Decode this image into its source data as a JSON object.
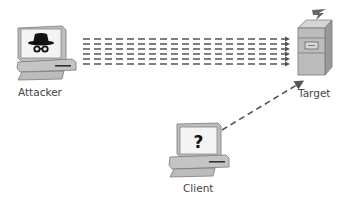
{
  "nodes": {
    "attacker": {
      "label": "Attacker",
      "icon": "spy-icon"
    },
    "target": {
      "label": "Target",
      "icon": "server-icon"
    },
    "client": {
      "label": "Client",
      "icon": "question-icon",
      "screen_glyph": "?"
    }
  },
  "edges": [
    {
      "from": "attacker",
      "to": "target",
      "style": "multi-dashed-flood",
      "lines": 6
    },
    {
      "from": "client",
      "to": "target",
      "style": "dashed-arrow"
    }
  ],
  "colors": {
    "device_gray": "#c8c8c8",
    "device_dark": "#8a8a8a",
    "dash": "#555555",
    "label": "#444444"
  }
}
